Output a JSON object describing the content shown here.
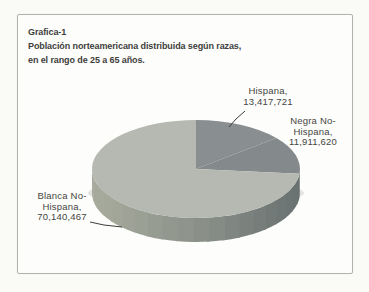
{
  "colors": {
    "paper": "#fafaf7",
    "frame_bg": "#fdfdfb",
    "frame_border": "#b3b1ac",
    "title_text": "#3e3e3c",
    "label_text": "#454542",
    "leader": "#3d3d3b"
  },
  "title": {
    "lines": [
      "Grafica-1",
      "Población norteamericana distribuida según razas,",
      "en el rango de 25 a 65 años."
    ]
  },
  "chart_data": {
    "type": "pie",
    "projection": "3d",
    "categories": [
      "Hispana",
      "Negra No-Hispana",
      "Blanca No-Hispana"
    ],
    "values": [
      13417721,
      11911620,
      70140467
    ],
    "total": 95469808,
    "percentages": [
      14.05,
      12.48,
      73.47
    ],
    "start_angle_deg": 0,
    "direction": "clockwise",
    "legend": "none",
    "labels": [
      {
        "lines": [
          "Hispana,",
          "13,417,721"
        ]
      },
      {
        "lines": [
          "Negra No-",
          "Hispana,",
          "11,911,620"
        ]
      },
      {
        "lines": [
          "Blanca No-",
          "Hispana,",
          "70,140,467"
        ]
      }
    ],
    "slice_colors": [
      {
        "top": "#898e91",
        "side": "#5f6668"
      },
      {
        "top": "#848a8c",
        "side": "#5f6668"
      },
      {
        "top": "#b6b9b1",
        "side_gradient": [
          "#a6aa9c",
          "#687071"
        ]
      }
    ]
  }
}
